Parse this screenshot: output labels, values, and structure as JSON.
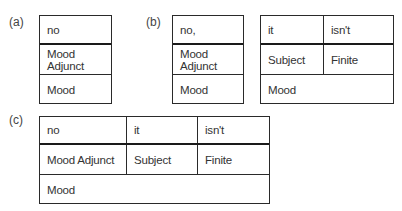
{
  "labels": {
    "a": "(a)",
    "b": "(b)",
    "c": "(c)"
  },
  "table_a": {
    "row1": [
      "no"
    ],
    "row2": [
      "Mood Adjunct"
    ],
    "row3": "Mood"
  },
  "table_b_left": {
    "row1": [
      "no,"
    ],
    "row2": [
      "Mood Adjunct"
    ],
    "row3": "Mood"
  },
  "table_b_right": {
    "row1": [
      "it",
      "isn't"
    ],
    "row2": [
      "Subject",
      "Finite"
    ],
    "row3": "Mood"
  },
  "table_c": {
    "row1": [
      "no",
      "it",
      "isn't"
    ],
    "row2": [
      "Mood Adjunct",
      "Subject",
      "Finite"
    ],
    "row3": "Mood"
  }
}
